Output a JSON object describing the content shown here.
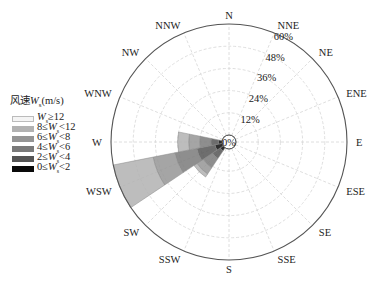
{
  "chart_data": {
    "type": "polar-bar",
    "title": "",
    "chart_kind": "wind rose",
    "directions": [
      "N",
      "NNE",
      "NE",
      "ENE",
      "E",
      "ESE",
      "SE",
      "SSE",
      "S",
      "SSW",
      "SW",
      "WSW",
      "W",
      "WNW",
      "NW",
      "NNW"
    ],
    "radial_ticks": [
      "0%",
      "12%",
      "24%",
      "36%",
      "48%",
      "60%"
    ],
    "radial_max": 60,
    "legend": {
      "title": "风速W_s(m/s)",
      "position": "left",
      "entries": [
        "W_s≥12",
        "8≤W_s<12",
        "6≤W_s<8",
        "4≤W_s<6",
        "2≤W_s<4",
        "0≤W_s<2"
      ]
    },
    "series": [
      {
        "name": "0≤W_s<2",
        "color": "#0a0a0a",
        "values": [
          0,
          0,
          0,
          0,
          0,
          0,
          0,
          0,
          0,
          0,
          2,
          4,
          2,
          0,
          0,
          0
        ]
      },
      {
        "name": "2≤W_s<4",
        "color": "#555555",
        "values": [
          0,
          0,
          0,
          0,
          0,
          0,
          0,
          0,
          0,
          0,
          5,
          10,
          4,
          0,
          0,
          0
        ]
      },
      {
        "name": "4≤W_s<6",
        "color": "#7a7a7a",
        "values": [
          0,
          0,
          0,
          0,
          0,
          0,
          0,
          0,
          0,
          0,
          6,
          12,
          6,
          0,
          0,
          0
        ]
      },
      {
        "name": "6≤W_s<8",
        "color": "#959595",
        "values": [
          0,
          0,
          0,
          0,
          0,
          0,
          0,
          0,
          0,
          0,
          4,
          12,
          6,
          0,
          0,
          0
        ]
      },
      {
        "name": "8≤W_s<12",
        "color": "#b2b2b2",
        "values": [
          0,
          0,
          0,
          0,
          0,
          0,
          0,
          0,
          0,
          0,
          2,
          22,
          6,
          0,
          0,
          0
        ]
      },
      {
        "name": "W_s≥12",
        "color": "#f2f2f2",
        "values": [
          0,
          0,
          0,
          0,
          0,
          0,
          0,
          0,
          0,
          0,
          0,
          0,
          0,
          0,
          0,
          0
        ]
      }
    ],
    "grid": true
  },
  "legend": {
    "title_prefix": "风速",
    "title_var": "W",
    "title_sub": "s",
    "title_unit": "(m/s)",
    "rows": [
      {
        "pre": "",
        "var": "W",
        "sub": "s",
        "post": "≥12",
        "color": "#f4f4f4",
        "border": "#bbbbbb"
      },
      {
        "pre": "8≤",
        "var": "W",
        "sub": "s",
        "post": "<12",
        "color": "#b2b2b2",
        "border": "#b2b2b2"
      },
      {
        "pre": "6≤",
        "var": "W",
        "sub": "s",
        "post": "<8",
        "color": "#959595",
        "border": "#959595"
      },
      {
        "pre": "4≤",
        "var": "W",
        "sub": "s",
        "post": "<6",
        "color": "#7a7a7a",
        "border": "#7a7a7a"
      },
      {
        "pre": "2≤",
        "var": "W",
        "sub": "s",
        "post": "<4",
        "color": "#555555",
        "border": "#555555"
      },
      {
        "pre": "0≤",
        "var": "W",
        "sub": "s",
        "post": "<2",
        "color": "#0a0a0a",
        "border": "#0a0a0a"
      }
    ]
  },
  "center_label": "0%",
  "colors": {
    "axis": "#555555",
    "grid": "#d6d6d6",
    "petal_edge": "#888888"
  }
}
